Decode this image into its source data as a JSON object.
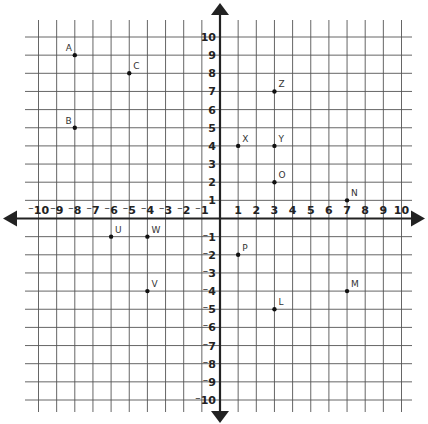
{
  "chart_data": {
    "type": "scatter",
    "title": "",
    "xlabel": "",
    "ylabel": "",
    "xlim": [
      -10,
      10
    ],
    "ylim": [
      -10,
      10
    ],
    "grid": true,
    "x_ticks": [
      "-10",
      "-9",
      "-8",
      "-7",
      "-6",
      "-5",
      "-4",
      "-3",
      "-2",
      "-1",
      "1",
      "2",
      "3",
      "4",
      "5",
      "6",
      "7",
      "8",
      "9",
      "10"
    ],
    "y_ticks": [
      "10",
      "9",
      "8",
      "7",
      "6",
      "5",
      "4",
      "3",
      "2",
      "1",
      "-1",
      "-2",
      "-3",
      "-4",
      "-5",
      "-6",
      "-7",
      "-8",
      "-9",
      "-10"
    ],
    "points": [
      {
        "label": "A",
        "x": -8,
        "y": 9
      },
      {
        "label": "B",
        "x": -8,
        "y": 5
      },
      {
        "label": "C",
        "x": -5,
        "y": 8
      },
      {
        "label": "Z",
        "x": 3,
        "y": 7
      },
      {
        "label": "X",
        "x": 1,
        "y": 4
      },
      {
        "label": "Y",
        "x": 3,
        "y": 4
      },
      {
        "label": "O",
        "x": 3,
        "y": 2
      },
      {
        "label": "N",
        "x": 7,
        "y": 1
      },
      {
        "label": "U",
        "x": -6,
        "y": -1
      },
      {
        "label": "W",
        "x": -4,
        "y": -1
      },
      {
        "label": "V",
        "x": -4,
        "y": -4
      },
      {
        "label": "P",
        "x": 1,
        "y": -2
      },
      {
        "label": "M",
        "x": 7,
        "y": -4
      },
      {
        "label": "L",
        "x": 3,
        "y": -5
      }
    ]
  }
}
